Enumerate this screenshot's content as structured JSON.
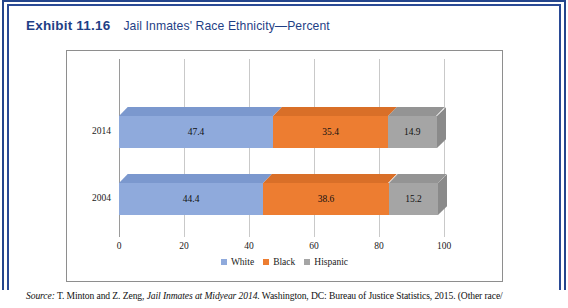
{
  "exhibit": {
    "label": "Exhibit 11.16",
    "title": "Jail Inmates' Race Ethnicity—Percent"
  },
  "source": {
    "prefix": "Source:",
    "authors": " T. Minton and Z. Zeng, ",
    "work": "Jail Inmates at Midyear 2014",
    "publication": ". Washington, DC: Bureau of Justice Statistics, 2015. (Other race/"
  },
  "colors": {
    "white_series": "#8FAADC",
    "black_series": "#ED7D31",
    "hispanic_series": "#A5A5A5",
    "white_top": "#7B98CE",
    "black_top": "#D96F28",
    "hispanic_top": "#949494",
    "white_end": "#6B89C2",
    "black_end": "#C4621F",
    "hispanic_end": "#8A8A8A",
    "frame_blue": "#24458c",
    "title_blue": "#1f3f86",
    "chart_border": "#8e8e8e",
    "gridline": "#c9c9c9"
  },
  "chart_data": {
    "type": "bar",
    "orientation": "horizontal",
    "stacked": true,
    "title": "Jail Inmates' Race Ethnicity—Percent",
    "xlabel": "",
    "ylabel": "",
    "categories": [
      "2014",
      "2004"
    ],
    "xticks": [
      0,
      20,
      40,
      60,
      80,
      100
    ],
    "xtick_labels": [
      "0",
      "20",
      "40",
      "60",
      "80",
      "100"
    ],
    "xlim": [
      0,
      100
    ],
    "grid": true,
    "legend_position": "bottom",
    "series": [
      {
        "name": "White",
        "color": "#8FAADC",
        "values": [
          47.4,
          44.4
        ],
        "labels": [
          "47.4",
          "44.4"
        ]
      },
      {
        "name": "Black",
        "color": "#ED7D31",
        "values": [
          35.4,
          38.6
        ],
        "labels": [
          "35.4",
          "38.6"
        ]
      },
      {
        "name": "Hispanic",
        "color": "#A5A5A5",
        "values": [
          14.9,
          15.2
        ],
        "labels": [
          "14.9",
          "15.2"
        ]
      }
    ]
  }
}
